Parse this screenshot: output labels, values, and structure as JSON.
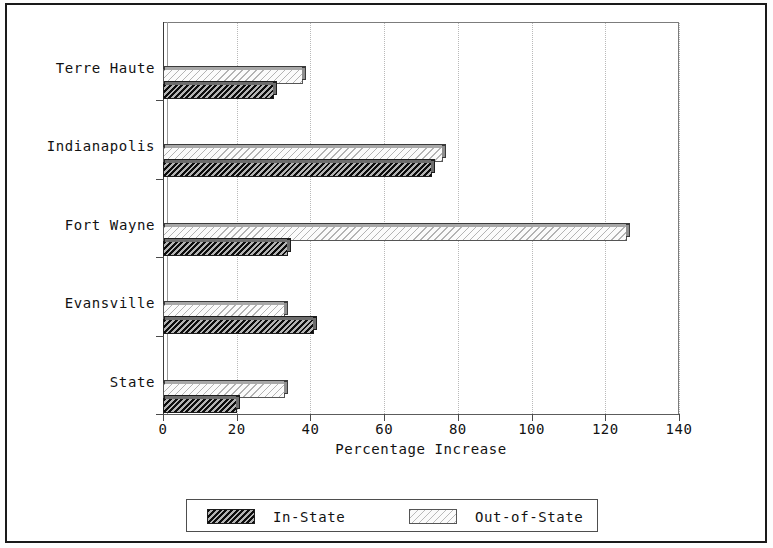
{
  "chart_data": {
    "type": "bar",
    "orientation": "horizontal",
    "title": "",
    "xlabel": "Percentage Increase",
    "ylabel": "",
    "categories": [
      "Terre Haute",
      "Indianapolis",
      "Fort Wayne",
      "Evansville",
      "State"
    ],
    "series": [
      {
        "name": "In-State",
        "values": [
          30,
          73,
          34,
          41,
          20
        ],
        "fill": "dark-hatch"
      },
      {
        "name": "Out-of-State",
        "values": [
          38,
          76,
          126,
          33,
          33
        ],
        "fill": "light-hatch"
      }
    ],
    "xlim": [
      0,
      140
    ],
    "xticks": [
      0,
      20,
      40,
      60,
      80,
      100,
      120,
      140
    ],
    "xticklabels": [
      "0",
      "20",
      "40",
      "60",
      "80",
      "100",
      "120",
      "140"
    ],
    "grid": true,
    "grid_axis": "x",
    "legend_position": "bottom",
    "legend_entries": [
      "In-State",
      "Out-of-State"
    ]
  },
  "axis": {
    "x_title": "Percentage Increase",
    "tick_labels": [
      "0",
      "20",
      "40",
      "60",
      "80",
      "100",
      "120",
      "140"
    ],
    "category_labels": [
      "Terre Haute",
      "Indianapolis",
      "Fort Wayne",
      "Evansville",
      "State"
    ]
  },
  "legend": {
    "in_state_label": "In-State",
    "out_of_state_label": "Out-of-State"
  },
  "colors": {
    "frame": "#1a1a1a",
    "axis": "#3a3a3a",
    "grid": "#b9b9b9",
    "in_state_fill": "#4a4a4a",
    "out_of_state_fill": "#fbfbfb",
    "text": "#121212"
  }
}
